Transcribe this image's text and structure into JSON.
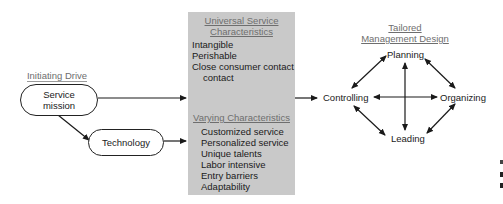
{
  "initiating": {
    "header": "Initiating Drive",
    "nodes": [
      "Service\nmission",
      "Technology"
    ]
  },
  "characteristics": {
    "universal_header": [
      "Universal Service",
      "Characteristics"
    ],
    "universal_items": [
      "Intangible",
      "Perishable",
      "Close consumer contact",
      "contact"
    ],
    "varying_header": "Varying Characteristics",
    "varying_items": [
      "Customized service",
      "Personalized service",
      "Unique talents",
      "Labor intensive",
      "Entry barriers",
      "Adaptability"
    ]
  },
  "management": {
    "header": [
      "Tailored",
      "Management Design"
    ],
    "functions": {
      "top": "Planning",
      "left": "Controlling",
      "right": "Organizing",
      "bottom": "Leading"
    }
  },
  "colors": {
    "box": "#c9c9c9",
    "header_text": "#6e6e6e",
    "line": "#1a1a1a"
  }
}
